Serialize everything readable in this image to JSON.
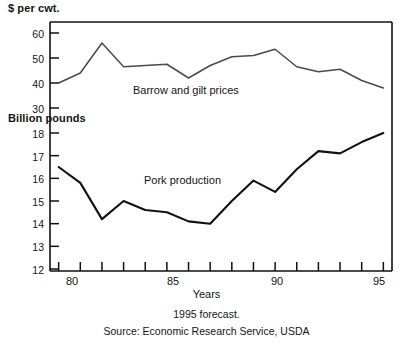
{
  "chart_data": {
    "type": "line",
    "title": "",
    "xlabel": "Years",
    "x": [
      80,
      81,
      82,
      83,
      84,
      85,
      86,
      87,
      88,
      89,
      90,
      91,
      92,
      93,
      94,
      95
    ],
    "xtick_labels": [
      "80",
      "85",
      "90",
      "95"
    ],
    "xtick_values": [
      80,
      85,
      90,
      95
    ],
    "xlim": [
      79.6,
      95.4
    ],
    "grid": false,
    "legend": "inline-labels",
    "panels": [
      {
        "name": "barrow-and-gilt-prices",
        "label": "Barrow and gilt prices",
        "ylabel": "$ per cwt.",
        "ylim": [
          30,
          62
        ],
        "ytick_labels": [
          "30",
          "40",
          "50",
          "60"
        ],
        "ytick_values": [
          30,
          40,
          50,
          60
        ],
        "values": [
          40.0,
          44.0,
          56.0,
          46.5,
          47.0,
          47.5,
          42.0,
          47.0,
          50.5,
          51.0,
          53.5,
          46.5,
          44.5,
          45.5,
          41.0,
          38.0
        ]
      },
      {
        "name": "pork-production",
        "label": "Pork production",
        "ylabel": "Billion pounds",
        "ylim": [
          12,
          18.6
        ],
        "ytick_labels": [
          "12",
          "13",
          "14",
          "15",
          "16",
          "17",
          "18"
        ],
        "ytick_values": [
          12,
          13,
          14,
          15,
          16,
          17,
          18
        ],
        "values": [
          16.5,
          15.8,
          14.2,
          15.0,
          14.6,
          14.5,
          14.1,
          14.0,
          15.0,
          15.9,
          15.4,
          16.4,
          17.2,
          17.1,
          17.6,
          18.0
        ]
      }
    ],
    "annotations": [
      "1995 forecast.",
      "Source: Economic Research Service, USDA"
    ]
  },
  "labels": {
    "unit_top": "$ per cwt.",
    "unit_bottom": "Billion pounds",
    "x_axis_title": "Years",
    "series_price": "Barrow and gilt prices",
    "series_production": "Pork production",
    "footnote_forecast": "1995 forecast.",
    "footnote_source": "Source: Economic Research Service, USDA"
  },
  "yticks_top": [
    "60",
    "50",
    "40",
    "30"
  ],
  "yticks_bottom": [
    "18",
    "17",
    "16",
    "15",
    "14",
    "13",
    "12"
  ],
  "xticks": [
    "80",
    "85",
    "90",
    "95"
  ],
  "colors": {
    "line_price": "#4a4a4a",
    "line_production": "#111111",
    "axis": "#111111",
    "text": "#141414",
    "background": "#ffffff"
  }
}
